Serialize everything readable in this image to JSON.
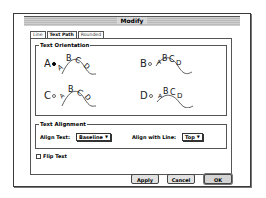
{
  "window": {
    "title": "Modify"
  },
  "tabs": [
    {
      "label": "Line",
      "active": false
    },
    {
      "label": "Text Path",
      "active": true
    },
    {
      "label": "Rounded",
      "active": false
    }
  ],
  "orientation": {
    "label": "Text Orientation",
    "options": [
      {
        "letter": "A",
        "sample": "ABCD",
        "selected": true
      },
      {
        "letter": "B",
        "sample": "ABCD",
        "selected": false
      },
      {
        "letter": "C",
        "sample": "ABCD",
        "selected": false
      },
      {
        "letter": "D",
        "sample": "ABCD",
        "selected": false
      }
    ]
  },
  "alignment": {
    "label": "Text Alignment",
    "align_text_label": "Align Text:",
    "align_text_value": "Baseline",
    "align_line_label": "Align with Line:",
    "align_line_value": "Top"
  },
  "flip": {
    "label": "Flip Text",
    "checked": false
  },
  "buttons": {
    "apply": "Apply",
    "cancel": "Cancel",
    "ok": "OK"
  }
}
